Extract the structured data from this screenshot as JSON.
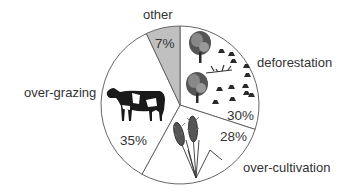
{
  "chart_data": {
    "type": "pie",
    "title": "",
    "categories": [
      "deforestation",
      "over-cultivation",
      "over-grazing",
      "other"
    ],
    "values": [
      30,
      28,
      35,
      7
    ],
    "unit": "%",
    "start_angle": "12 o'clock, clockwise",
    "slices": [
      {
        "label": "deforestation",
        "value": 30,
        "value_label": "30%",
        "fill": "#ffffff",
        "icon": "tree-stumps-icon"
      },
      {
        "label": "over-cultivation",
        "value": 28,
        "value_label": "28%",
        "fill": "#ffffff",
        "icon": "wheat-icon"
      },
      {
        "label": "over-grazing",
        "value": 35,
        "value_label": "35%",
        "fill": "#ffffff",
        "icon": "cow-icon"
      },
      {
        "label": "other",
        "value": 7,
        "value_label": "7%",
        "fill": "#c0c0c0",
        "icon": ""
      }
    ],
    "legend": "none (labels placed outside slices)"
  },
  "colors": {
    "outline": "#666666",
    "text": "#333333",
    "other_fill": "#c0c0c0",
    "background": "#ffffff"
  }
}
